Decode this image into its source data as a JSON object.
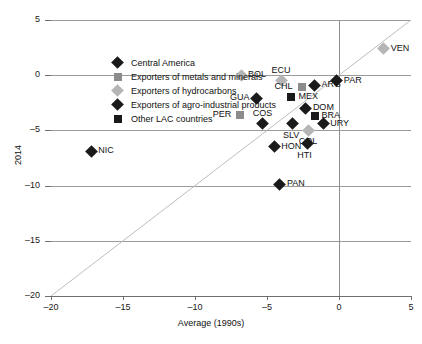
{
  "chart_data": {
    "type": "scatter",
    "title": "",
    "xlabel": "Average (1990s)",
    "ylabel": "2014",
    "xlim": [
      -20,
      5
    ],
    "ylim": [
      -20,
      5
    ],
    "xticks": [
      -20,
      -15,
      -10,
      -5,
      0,
      5
    ],
    "yticks": [
      5,
      0,
      -5,
      -10,
      -15,
      -20
    ],
    "xtick_labels": [
      "–20",
      "–15",
      "–10",
      "–5",
      "0",
      "5"
    ],
    "ytick_labels": [
      "5",
      "0",
      "–5",
      "–10",
      "–15",
      "–20"
    ],
    "grid": "horizontal",
    "reference_line": "45-degree diagonal y = x",
    "legend_position": "upper-left inside plot",
    "series": [
      {
        "name": "Central America",
        "marker": "diamond",
        "color": "#1a1a1a"
      },
      {
        "name": "Exporters of metals and minerals",
        "marker": "square",
        "color": "#8c8c8c"
      },
      {
        "name": "Exporters of hydrocarbons",
        "marker": "diamond",
        "color": "#b5b5b5"
      },
      {
        "name": "Exporters of agro-industrial products",
        "marker": "diamond",
        "color": "#1a1a1a"
      },
      {
        "name": "Other LAC countries",
        "marker": "square",
        "color": "#1a1a1a"
      }
    ],
    "points": [
      {
        "label": "VEN",
        "x": 3.1,
        "y": 2.4,
        "marker": "diamond",
        "color": "#b5b5b5",
        "label_pos": "right"
      },
      {
        "label": "BOL",
        "x": -6.8,
        "y": 0.0,
        "marker": "diamond",
        "color": "#b5b5b5",
        "label_pos": "right"
      },
      {
        "label": "ECU",
        "x": -4.0,
        "y": -0.5,
        "marker": "diamond",
        "color": "#b5b5b5",
        "label_pos": "above"
      },
      {
        "label": "PAR",
        "x": -0.15,
        "y": -0.5,
        "marker": "diamond",
        "color": "#1a1a1a",
        "label_pos": "right"
      },
      {
        "label": "ARG",
        "x": -1.7,
        "y": -0.9,
        "marker": "diamond",
        "color": "#1a1a1a",
        "label_pos": "right"
      },
      {
        "label": "CHL",
        "x": -2.6,
        "y": -1.1,
        "marker": "square",
        "color": "#8c8c8c",
        "label_pos": "left"
      },
      {
        "label": "MEX",
        "x": -3.3,
        "y": -2.0,
        "marker": "square",
        "color": "#1a1a1a",
        "label_pos": "right"
      },
      {
        "label": "GUA",
        "x": -5.7,
        "y": -2.1,
        "marker": "diamond",
        "color": "#1a1a1a",
        "label_pos": "left"
      },
      {
        "label": "DOM",
        "x": -2.3,
        "y": -3.0,
        "marker": "diamond",
        "color": "#1a1a1a",
        "label_pos": "right"
      },
      {
        "label": "BRA",
        "x": -1.7,
        "y": -3.7,
        "marker": "square",
        "color": "#1a1a1a",
        "label_pos": "right"
      },
      {
        "label": "PER",
        "x": -6.9,
        "y": -3.6,
        "marker": "square",
        "color": "#8c8c8c",
        "label_pos": "left"
      },
      {
        "label": "COS",
        "x": -5.3,
        "y": -4.4,
        "marker": "diamond",
        "color": "#1a1a1a",
        "label_pos": "above"
      },
      {
        "label": "URY",
        "x": -1.1,
        "y": -4.4,
        "marker": "diamond",
        "color": "#1a1a1a",
        "label_pos": "right"
      },
      {
        "label": "SLV",
        "x": -3.2,
        "y": -4.4,
        "marker": "diamond",
        "color": "#1a1a1a",
        "label_pos": "below"
      },
      {
        "label": "COL",
        "x": -2.1,
        "y": -5.0,
        "marker": "diamond",
        "color": "#b5b5b5",
        "label_pos": "below"
      },
      {
        "label": "HTI",
        "x": -2.2,
        "y": -6.2,
        "marker": "diamond",
        "color": "#1a1a1a",
        "label_pos": "below"
      },
      {
        "label": "HON",
        "x": -4.5,
        "y": -6.5,
        "marker": "diamond",
        "color": "#1a1a1a",
        "label_pos": "right"
      },
      {
        "label": "NIC",
        "x": -17.2,
        "y": -6.9,
        "marker": "diamond",
        "color": "#1a1a1a",
        "label_pos": "right"
      },
      {
        "label": "PAN",
        "x": -4.1,
        "y": -9.9,
        "marker": "diamond",
        "color": "#1a1a1a",
        "label_pos": "right"
      }
    ]
  }
}
